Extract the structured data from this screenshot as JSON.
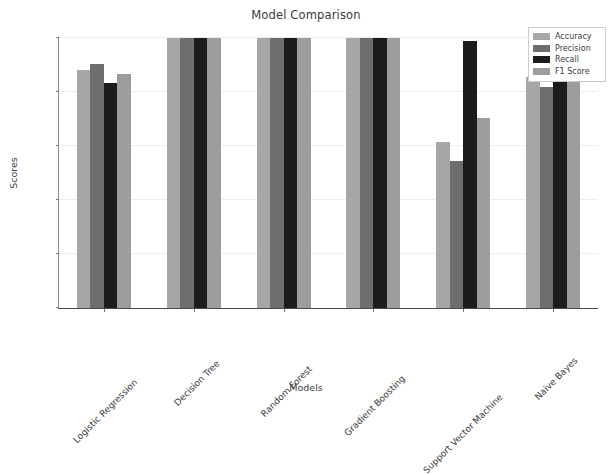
{
  "chart_data": {
    "type": "bar",
    "title": "Model Comparison",
    "xlabel": "Models",
    "ylabel": "Scores",
    "ylim": [
      0.0,
      1.0
    ],
    "yticks": [
      "0.0",
      "0.2",
      "0.4",
      "0.6",
      "0.8",
      "1.0"
    ],
    "ytick_values": [
      0.0,
      0.2,
      0.4,
      0.6,
      0.8,
      1.0
    ],
    "grid": true,
    "legend_position": "upper right",
    "categories": [
      "Logistic Regression",
      "Decision Tree",
      "Random Forest",
      "Gradient Boosting",
      "Support Vector Machine",
      "Naive Bayes"
    ],
    "series": [
      {
        "name": "Accuracy",
        "color": "#a6a6a6",
        "values": [
          0.88,
          1.0,
          1.0,
          1.0,
          0.615,
          0.855
        ]
      },
      {
        "name": "Precision",
        "color": "#6e6e6e",
        "values": [
          0.903,
          1.0,
          1.0,
          1.0,
          0.545,
          0.82
        ]
      },
      {
        "name": "Recall",
        "color": "#1c1c1c",
        "values": [
          0.835,
          1.0,
          1.0,
          1.0,
          0.988,
          0.865
        ]
      },
      {
        "name": "F1 Score",
        "color": "#9d9d9d",
        "values": [
          0.868,
          1.0,
          1.0,
          1.0,
          0.705,
          0.845
        ]
      }
    ]
  },
  "figure": {
    "background_color": "#ffffff",
    "axes_color": "#4a4a4a",
    "grid_color": "#ededed",
    "text_color": "#3c3c3c"
  }
}
